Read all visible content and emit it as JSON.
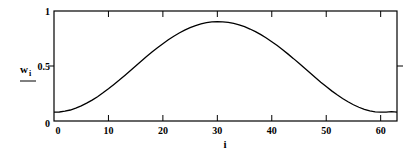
{
  "chart_data": {
    "type": "line",
    "title": "",
    "xlabel": "i",
    "ylabel": "w_i",
    "ylabel_main": "w",
    "ylabel_sub": "i",
    "xlim": [
      0,
      63
    ],
    "ylim": [
      0,
      1
    ],
    "x_ticks": [
      0,
      10,
      20,
      30,
      40,
      50,
      60
    ],
    "x_tick_labels": [
      "0",
      "10",
      "20",
      "30",
      "40",
      "50",
      "60"
    ],
    "y_ticks": [
      0,
      0.5,
      1
    ],
    "y_tick_labels": [
      "0",
      "0.5",
      "1"
    ],
    "grid": false,
    "legend": null,
    "series": [
      {
        "name": "w_i",
        "description": "Hamming window w_i = 0.54 - 0.46*cos(2*pi*i/63), i = 0..63",
        "x": [
          0,
          1,
          2,
          3,
          4,
          5,
          6,
          7,
          8,
          9,
          10,
          11,
          12,
          13,
          14,
          15,
          16,
          17,
          18,
          19,
          20,
          21,
          22,
          23,
          24,
          25,
          26,
          27,
          28,
          29,
          30,
          31,
          32,
          33,
          34,
          35,
          36,
          37,
          38,
          39,
          40,
          41,
          42,
          43,
          44,
          45,
          46,
          47,
          48,
          49,
          50,
          51,
          52,
          53,
          54,
          55,
          56,
          57,
          58,
          59,
          60,
          61,
          62,
          63
        ],
        "values": [
          0.08,
          0.082,
          0.089,
          0.1,
          0.117,
          0.137,
          0.162,
          0.19,
          0.221,
          0.256,
          0.293,
          0.332,
          0.372,
          0.414,
          0.457,
          0.5,
          0.543,
          0.586,
          0.627,
          0.666,
          0.703,
          0.738,
          0.771,
          0.8,
          0.826,
          0.849,
          0.868,
          0.883,
          0.894,
          0.901,
          0.904,
          0.902,
          0.897,
          0.887,
          0.874,
          0.857,
          0.836,
          0.812,
          0.785,
          0.755,
          0.721,
          0.686,
          0.648,
          0.608,
          0.567,
          0.524,
          0.481,
          0.438,
          0.395,
          0.353,
          0.313,
          0.274,
          0.238,
          0.205,
          0.175,
          0.148,
          0.125,
          0.106,
          0.092,
          0.083,
          0.08,
          0.081,
          0.086,
          0.08
        ]
      }
    ]
  }
}
